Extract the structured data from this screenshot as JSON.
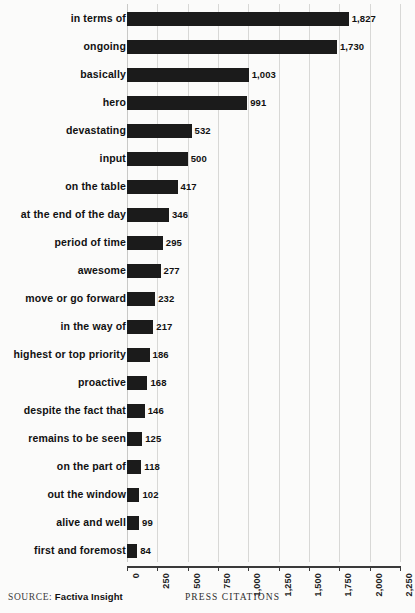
{
  "chart_data": {
    "type": "bar",
    "orientation": "horizontal",
    "title": "",
    "xlabel": "PRESS CITATIONS",
    "ylabel": "",
    "xlim": [
      0,
      2250
    ],
    "grid": true,
    "legend": null,
    "xticks": [
      "0",
      "250",
      "500",
      "750",
      "1,000",
      "1,250",
      "1,500",
      "1,750",
      "2,000",
      "2,250"
    ],
    "xtick_values": [
      0,
      250,
      500,
      750,
      1000,
      1250,
      1500,
      1750,
      2000,
      2250
    ],
    "categories": [
      "in terms of",
      "ongoing",
      "basically",
      "hero",
      "devastating",
      "input",
      "on the table",
      "at the end of the day",
      "period of time",
      "awesome",
      "move or go forward",
      "in the way of",
      "highest or top priority",
      "proactive",
      "despite the fact that",
      "remains to be seen",
      "on the part of",
      "out the window",
      "alive and well",
      "first and foremost"
    ],
    "values": [
      1827,
      1730,
      1003,
      991,
      532,
      500,
      417,
      346,
      295,
      277,
      232,
      217,
      186,
      168,
      146,
      125,
      118,
      102,
      99,
      84
    ],
    "value_labels": [
      "1,827",
      "1,730",
      "1,003",
      "991",
      "532",
      "500",
      "417",
      "346",
      "295",
      "277",
      "232",
      "217",
      "186",
      "168",
      "146",
      "125",
      "118",
      "102",
      "99",
      "84"
    ],
    "bar_color": "#1b1b1b",
    "background_color": "#fbfbfa",
    "gridline_color": "#d8d8d6"
  },
  "footer": {
    "source_word": "SOURCE:",
    "source_name": "Factiva Insight",
    "axis_title": "PRESS CITATIONS"
  }
}
